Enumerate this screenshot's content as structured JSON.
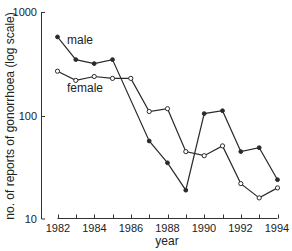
{
  "chart_data": {
    "type": "line",
    "title": "",
    "xlabel": "year",
    "ylabel": "no. of reports of gonorrhoea (log scale)",
    "yscale": "log",
    "ylim": [
      10,
      1000
    ],
    "xlim": [
      1982,
      1994
    ],
    "grid": false,
    "legend_position": "inline labels",
    "x_ticks": [
      1982,
      1983,
      1984,
      1985,
      1986,
      1987,
      1988,
      1989,
      1990,
      1991,
      1992,
      1993,
      1994
    ],
    "x_tick_labels": [
      "1982",
      "1984",
      "1986",
      "1988",
      "1990",
      "1992",
      "1994"
    ],
    "y_tick_labels": [
      "10",
      "100",
      "1000"
    ],
    "series": [
      {
        "name": "male",
        "marker": "filled-circle",
        "x": [
          1982,
          1983,
          1984,
          1985,
          1987,
          1988,
          1989,
          1990,
          1991,
          1992,
          1993,
          1994
        ],
        "values": [
          580,
          350,
          320,
          350,
          57,
          35,
          19,
          105,
          112,
          45,
          49,
          24
        ]
      },
      {
        "name": "female",
        "marker": "open-circle",
        "x": [
          1982,
          1983,
          1984,
          1985,
          1986,
          1987,
          1988,
          1989,
          1990,
          1991,
          1992,
          1993,
          1994
        ],
        "values": [
          270,
          220,
          240,
          230,
          230,
          110,
          117,
          45,
          41,
          51,
          22,
          16,
          20
        ]
      }
    ],
    "annotations": [
      {
        "text": "male",
        "near": "male series, 1983"
      },
      {
        "text": "female",
        "near": "female series, 1984"
      }
    ]
  },
  "labels": {
    "male": "male",
    "female": "female",
    "xlabel": "year",
    "ylabel": "no. of reports of gonorrhoea (log scale)",
    "y_1000": "1000",
    "y_100": "100",
    "y_10": "10",
    "x_1982": "1982",
    "x_1984": "1984",
    "x_1986": "1986",
    "x_1988": "1988",
    "x_1990": "1990",
    "x_1992": "1992",
    "x_1994": "1994"
  },
  "colors": {
    "line": "#2a2a2a",
    "axis": "#333333",
    "background": "#ffffff"
  }
}
